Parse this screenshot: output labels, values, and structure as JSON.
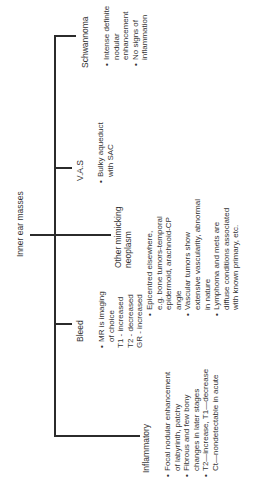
{
  "root": {
    "label": "Inner ear masses"
  },
  "branches": [
    {
      "label": "Schwannoma",
      "bullets": [
        {
          "lines": [
            "Intense definite",
            "nodular",
            "enhancement"
          ]
        },
        {
          "lines": [
            "No signs of",
            "inflammation"
          ]
        }
      ]
    },
    {
      "label": "V.A.S",
      "bullets": [
        {
          "lines": [
            "Bulky aqueduct",
            "with SAC"
          ]
        }
      ]
    },
    {
      "label_lines": [
        "Other mimicking",
        "neoplasm"
      ],
      "bullets": [
        {
          "lines": [
            "Epicentred elsewhere,",
            "e.g. bone tumors-temporal",
            "epidermoid, arachnoid-CP",
            "angle"
          ]
        },
        {
          "lines": [
            "Vascular tumors show",
            "extensive vascularity, abnormal",
            "in nature"
          ]
        },
        {
          "lines": [
            "Lymphoma and mets are",
            "diffuse conditions associated",
            "with known primary, etc."
          ]
        }
      ]
    },
    {
      "label": "Bleed",
      "bullets": [
        {
          "lines": [
            "MR is imaging",
            "of choice",
            "T1 - increased",
            "T2 - decreased",
            "GR - increased"
          ]
        }
      ]
    },
    {
      "label": "Inflammatory",
      "bullets": [
        {
          "lines": [
            "Focal nodular enhancement",
            "of labyrinth, patchy"
          ]
        },
        {
          "lines": [
            "Fibrous and few bony",
            "changes in later stages"
          ]
        },
        {
          "lines": [
            "T2—increase, T1—decrease",
            "Ct—nondetectable in acute"
          ]
        }
      ]
    }
  ]
}
